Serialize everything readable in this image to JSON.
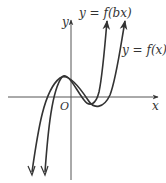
{
  "figure": {
    "axes": {
      "x_label": "x",
      "y_label": "y",
      "origin_label": "O"
    },
    "curves": [
      {
        "name": "f(x)",
        "label": "y = f(x)"
      },
      {
        "name": "f(bx)",
        "label": "y = f(bx)"
      }
    ],
    "colors": {
      "curve": "#333333",
      "axis": "#555555"
    }
  }
}
